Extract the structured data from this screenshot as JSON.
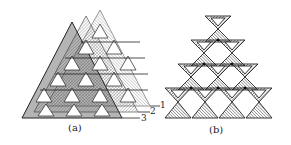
{
  "figure": {
    "panels": [
      {
        "id": "a",
        "caption": "(a)",
        "description": "Close-packed tetrahedral pyramid built from stacked triangular layers",
        "layer_labels": [
          "1",
          "2",
          "3"
        ]
      },
      {
        "id": "b",
        "caption": "(b)",
        "description": "Stack of corner-sharing double tetrahedra (hourglass units) in rows of 1, 2, 3, 4",
        "rows": [
          1,
          2,
          3,
          4
        ],
        "layer_labels": [
          "1"
        ]
      }
    ],
    "colors": {
      "line": "#222222",
      "hatch": "#555555",
      "background": "#ffffff"
    }
  }
}
